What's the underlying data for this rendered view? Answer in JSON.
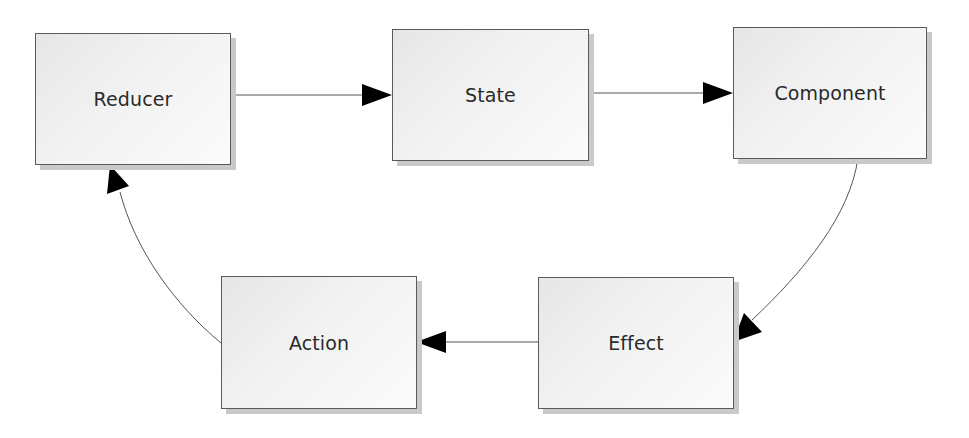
{
  "diagram": {
    "type": "flow-cycle",
    "nodes": [
      {
        "id": "reducer",
        "label": "Reducer"
      },
      {
        "id": "state",
        "label": "State"
      },
      {
        "id": "component",
        "label": "Component"
      },
      {
        "id": "effect",
        "label": "Effect"
      },
      {
        "id": "action",
        "label": "Action"
      }
    ],
    "edges": [
      {
        "from": "reducer",
        "to": "state",
        "style": "straight"
      },
      {
        "from": "state",
        "to": "component",
        "style": "straight"
      },
      {
        "from": "component",
        "to": "effect",
        "style": "curved"
      },
      {
        "from": "effect",
        "to": "action",
        "style": "straight"
      },
      {
        "from": "action",
        "to": "reducer",
        "style": "curved"
      }
    ],
    "colors": {
      "border": "#5a5a5a",
      "shadow": "#c9c9c9",
      "fill_start": "#e6e6e6",
      "fill_end": "#fbfbfb",
      "edge": "#555555",
      "arrowhead": "#000000",
      "text": "#2a2a2a"
    }
  }
}
